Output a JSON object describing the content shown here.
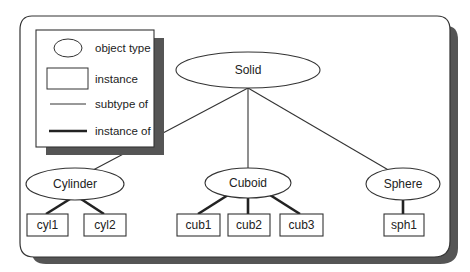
{
  "diagram": {
    "type": "object-type hierarchy",
    "colors": {
      "background": "#ffffff",
      "frame_shadow": "#555555",
      "line": "#222222"
    },
    "legend": {
      "items": [
        {
          "symbol": "ellipse",
          "label": "object type"
        },
        {
          "symbol": "rectangle",
          "label": "instance"
        },
        {
          "symbol": "thin-line",
          "label": "subtype of"
        },
        {
          "symbol": "thick-line",
          "label": "instance of"
        }
      ]
    },
    "root": {
      "label": "Solid"
    },
    "types": [
      {
        "label": "Cylinder",
        "instances": [
          "cyl1",
          "cyl2"
        ]
      },
      {
        "label": "Cuboid",
        "instances": [
          "cub1",
          "cub2",
          "cub3"
        ]
      },
      {
        "label": "Sphere",
        "instances": [
          "sph1"
        ]
      }
    ],
    "edges": {
      "subtype_of": [
        [
          "Cylinder",
          "Solid"
        ],
        [
          "Cuboid",
          "Solid"
        ],
        [
          "Sphere",
          "Solid"
        ]
      ],
      "instance_of": [
        [
          "cyl1",
          "Cylinder"
        ],
        [
          "cyl2",
          "Cylinder"
        ],
        [
          "cub1",
          "Cuboid"
        ],
        [
          "cub2",
          "Cuboid"
        ],
        [
          "cub3",
          "Cuboid"
        ],
        [
          "sph1",
          "Sphere"
        ]
      ]
    }
  }
}
